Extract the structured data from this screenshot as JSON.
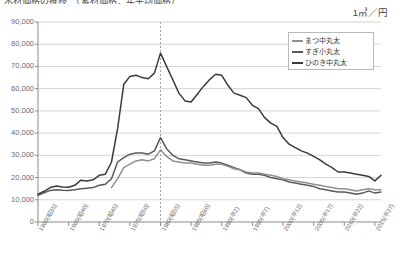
{
  "title": "木材価格の推移　（素材価格：年平均価格）",
  "unit_label": "1㎥／円",
  "legend": {
    "items": [
      {
        "label": "まつ中丸太",
        "color": "#8f8f8f"
      },
      {
        "label": "すぎ小丸太",
        "color": "#595959"
      },
      {
        "label": "ひのき中丸太",
        "color": "#3a3a3a"
      }
    ]
  },
  "axis": {
    "y_ticks": [
      "0",
      "10,000",
      "20,000",
      "30,000",
      "40,000",
      "50,000",
      "60,000",
      "70,000",
      "80,000",
      "90,000"
    ],
    "x_ticks": [
      "1960(昭35)",
      "1965(昭40)",
      "1970(昭45)",
      "1975(昭50)",
      "1980(昭55)",
      "1985(昭60)",
      "1990(平2)",
      "1995(平7)",
      "2000(平12)",
      "2005(平17)",
      "2010(平22)",
      "2015(平27)"
    ]
  },
  "chart_data": {
    "type": "line",
    "title": "木材価格の推移　（素材価格：年平均価格）",
    "xlabel": "",
    "ylabel": "1㎥／円",
    "ylim": [
      0,
      90000
    ],
    "xlim": [
      1960,
      2016
    ],
    "grid": true,
    "legend_position": "top-right",
    "annotations": [
      {
        "type": "vline",
        "x": 1980,
        "style": "dashed",
        "color": "#999999"
      }
    ],
    "x": [
      1960,
      1961,
      1962,
      1963,
      1964,
      1965,
      1966,
      1967,
      1968,
      1969,
      1970,
      1971,
      1972,
      1973,
      1974,
      1975,
      1976,
      1977,
      1978,
      1979,
      1980,
      1981,
      1982,
      1983,
      1984,
      1985,
      1986,
      1987,
      1988,
      1989,
      1990,
      1991,
      1992,
      1993,
      1994,
      1995,
      1996,
      1997,
      1998,
      1999,
      2000,
      2001,
      2002,
      2003,
      2004,
      2005,
      2006,
      2007,
      2008,
      2009,
      2010,
      2011,
      2012,
      2013,
      2014,
      2015,
      2016
    ],
    "series": [
      {
        "name": "ひのき中丸太",
        "color": "#3a3a3a",
        "values": [
          12500,
          13800,
          15500,
          16200,
          15800,
          15600,
          16500,
          18800,
          18500,
          19000,
          21000,
          21500,
          27000,
          42000,
          62000,
          65500,
          66000,
          65000,
          64500,
          67000,
          76000,
          70000,
          64000,
          58000,
          54500,
          54000,
          57500,
          61000,
          64000,
          66500,
          66000,
          61500,
          58000,
          57000,
          56000,
          52500,
          51000,
          47000,
          44500,
          43000,
          38000,
          35000,
          33500,
          32000,
          31000,
          29500,
          28000,
          26000,
          24500,
          22500,
          22500,
          22000,
          21500,
          21000,
          20500,
          18500,
          21000
        ]
      },
      {
        "name": "すぎ小丸太",
        "color": "#595959",
        "values": [
          12000,
          13200,
          14200,
          14500,
          14300,
          14200,
          14500,
          15000,
          15200,
          15500,
          16500,
          17000,
          19500,
          27000,
          29000,
          30500,
          31000,
          31000,
          30500,
          32000,
          38000,
          33000,
          30000,
          28500,
          28000,
          27500,
          27000,
          26500,
          26500,
          27000,
          26500,
          25500,
          24500,
          23500,
          22000,
          21500,
          21500,
          21000,
          20000,
          19500,
          19000,
          18000,
          17500,
          17000,
          16500,
          16000,
          15000,
          14500,
          14000,
          13500,
          13500,
          13000,
          12500,
          13000,
          14000,
          13000,
          13500
        ]
      },
      {
        "name": "まつ中丸太",
        "color": "#8f8f8f",
        "values": [
          null,
          null,
          null,
          null,
          null,
          null,
          null,
          null,
          null,
          null,
          null,
          null,
          15500,
          19500,
          24500,
          26000,
          27500,
          28000,
          27500,
          28500,
          32500,
          29500,
          27500,
          27000,
          26500,
          26500,
          26000,
          25500,
          25500,
          26000,
          26000,
          25000,
          24000,
          23500,
          22500,
          22000,
          22000,
          21500,
          21000,
          20500,
          19500,
          19000,
          18500,
          18000,
          17500,
          17000,
          16500,
          16000,
          15500,
          15000,
          15000,
          14500,
          14000,
          14500,
          15000,
          14500,
          14500
        ]
      }
    ]
  }
}
